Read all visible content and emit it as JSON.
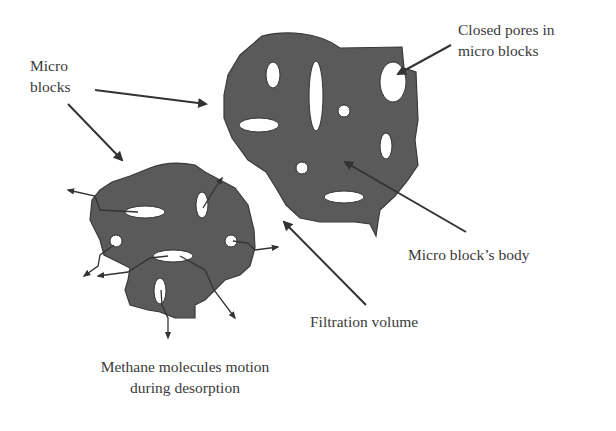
{
  "diagram": {
    "labels": {
      "micro_blocks_line1": "Micro",
      "micro_blocks_line2": "blocks",
      "closed_pores_line1": "Closed pores in",
      "closed_pores_line2": "micro blocks",
      "block_body": "Micro block’s body",
      "filtration_volume": "Filtration volume",
      "methane_line1": "Methane molecules motion",
      "methane_line2": "during desorption"
    },
    "colors": {
      "block_fill": "#5a5a5a",
      "block_edge": "#3a3a3a",
      "pore_fill": "#ffffff",
      "arrow": "#333333",
      "text": "#3a3a3a",
      "background": "#ffffff"
    },
    "elements": [
      {
        "id": "large-micro-block",
        "type": "blob",
        "pores": 8
      },
      {
        "id": "small-micro-block",
        "type": "blob",
        "pores": 6,
        "desorption_arrows": 8
      }
    ]
  }
}
